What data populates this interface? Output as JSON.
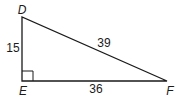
{
  "diagram": {
    "type": "right-triangle",
    "vertices": [
      {
        "id": "D",
        "label": "D",
        "x": 22,
        "y": 17
      },
      {
        "id": "E",
        "label": "E",
        "x": 22,
        "y": 81
      },
      {
        "id": "F",
        "label": "F",
        "x": 167,
        "y": 81
      }
    ],
    "right_angle_at": "E",
    "sides": [
      {
        "name": "DE",
        "label": "15"
      },
      {
        "name": "DF",
        "label": "39"
      },
      {
        "name": "EF",
        "label": "36"
      }
    ],
    "stroke_color": "#1a1a1a"
  }
}
